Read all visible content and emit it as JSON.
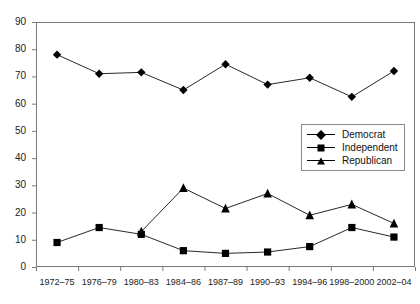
{
  "chart_data": {
    "type": "line",
    "title": "",
    "subtitle": "",
    "xlabel": "",
    "ylabel": "",
    "ylim": [
      0,
      90
    ],
    "ytick_step": 10,
    "yticks": [
      "0",
      "10",
      "20",
      "30",
      "40",
      "50",
      "60",
      "70",
      "80",
      "90"
    ],
    "grid": false,
    "legend_position": "inside-right-middle",
    "categories": [
      "1972–75",
      "1976–79",
      "1980–83",
      "1984–86",
      "1987–89",
      "1990–93",
      "1994–96",
      "1998–2000",
      "2002–04"
    ],
    "series": [
      {
        "name": "Democrat",
        "marker": "diamond",
        "values": [
          78,
          71,
          71.5,
          65,
          74.5,
          67,
          69.5,
          62.5,
          72
        ]
      },
      {
        "name": "Independent",
        "marker": "square",
        "values": [
          9,
          14.5,
          12,
          6,
          5,
          5.5,
          7.5,
          14.5,
          11
        ]
      },
      {
        "name": "Republican",
        "marker": "triangle",
        "values": [
          null,
          null,
          13,
          29,
          21.5,
          27,
          19,
          23,
          16
        ]
      }
    ]
  },
  "legend": {
    "items": [
      {
        "label": "Democrat",
        "marker": "diamond"
      },
      {
        "label": "Independent",
        "marker": "square"
      },
      {
        "label": "Republican",
        "marker": "triangle"
      }
    ]
  }
}
